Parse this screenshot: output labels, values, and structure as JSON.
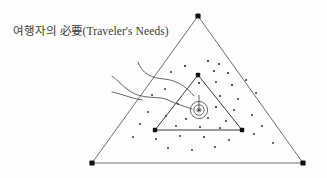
{
  "figure": {
    "caption": "여행자의 必要(Traveler's Needs)",
    "caption_korean": "여행자의",
    "caption_hanja": "必要",
    "caption_english": "(Traveler's Needs)",
    "background_color": "#fdfdfd",
    "line_color": "#4a4a4a",
    "dot_color": "#222222",
    "vertex_color": "#111111",
    "width": 327,
    "height": 178
  },
  "chart_data": {
    "type": "scatter",
    "title": "여행자의 必要(Traveler's Needs)",
    "xlabel": "",
    "ylabel": "",
    "xlim": [
      0,
      327
    ],
    "ylim": [
      0,
      178
    ],
    "grid": false,
    "legend": "none",
    "annotations": [
      "outer-triangle",
      "inner-triangle",
      "spiral-target",
      "flow-curves"
    ],
    "outer_triangle": {
      "label": "outer-triangle",
      "vertices": [
        {
          "name": "apex",
          "x": 198,
          "y": 16
        },
        {
          "name": "bottom-left",
          "x": 92,
          "y": 163
        },
        {
          "name": "bottom-right",
          "x": 303,
          "y": 163
        }
      ],
      "vertex_marker": "filled-square",
      "vertex_size": 5.0,
      "stroke_width": 0.9
    },
    "inner_triangle": {
      "label": "inner-triangle",
      "vertices": [
        {
          "name": "apex",
          "x": 198,
          "y": 75
        },
        {
          "name": "bottom-left",
          "x": 155,
          "y": 130
        },
        {
          "name": "bottom-right",
          "x": 242,
          "y": 130
        }
      ],
      "vertex_marker": "filled-square",
      "vertex_size": 4.2,
      "stroke_width": 1.0
    },
    "spiral": {
      "label": "spiral-target",
      "center": {
        "x": 199,
        "y": 110
      },
      "radii": [
        2.0,
        5.2,
        8.6
      ],
      "center_dot_radius": 1.1,
      "stem": {
        "x": 199,
        "y_top": 95,
        "y_bottom": 108
      }
    },
    "curves": [
      {
        "name": "flow-curve-upper",
        "path": "M 138,62 C 142,74 152,78 164,79 C 176,80 186,86 194,96"
      },
      {
        "name": "flow-curve-lower",
        "path": "M 112,76 C 122,84 128,92 138,95 C 150,99 160,96 168,100 C 176,104 184,106 192,109"
      },
      {
        "name": "flow-curve-tail",
        "path": "M 112,92 C 122,94 130,98 142,100"
      }
    ],
    "scatter_points": [
      {
        "x": 185,
        "y": 66,
        "r": 1.0
      },
      {
        "x": 208,
        "y": 61,
        "r": 1.0
      },
      {
        "x": 219,
        "y": 64,
        "r": 1.0
      },
      {
        "x": 171,
        "y": 72,
        "r": 0.9
      },
      {
        "x": 214,
        "y": 71,
        "r": 1.0
      },
      {
        "x": 228,
        "y": 73,
        "r": 1.0
      },
      {
        "x": 199,
        "y": 83,
        "r": 1.0
      },
      {
        "x": 216,
        "y": 82,
        "r": 0.9
      },
      {
        "x": 232,
        "y": 85,
        "r": 1.0
      },
      {
        "x": 165,
        "y": 89,
        "r": 0.9
      },
      {
        "x": 246,
        "y": 80,
        "r": 1.0
      },
      {
        "x": 152,
        "y": 95,
        "r": 0.9
      },
      {
        "x": 220,
        "y": 96,
        "r": 1.0
      },
      {
        "x": 238,
        "y": 99,
        "r": 0.9
      },
      {
        "x": 256,
        "y": 93,
        "r": 0.9
      },
      {
        "x": 178,
        "y": 104,
        "r": 0.9
      },
      {
        "x": 216,
        "y": 107,
        "r": 1.0
      },
      {
        "x": 234,
        "y": 110,
        "r": 0.9
      },
      {
        "x": 148,
        "y": 112,
        "r": 0.9
      },
      {
        "x": 166,
        "y": 116,
        "r": 0.9
      },
      {
        "x": 186,
        "y": 119,
        "r": 0.9
      },
      {
        "x": 208,
        "y": 118,
        "r": 0.9
      },
      {
        "x": 226,
        "y": 121,
        "r": 0.9
      },
      {
        "x": 252,
        "y": 115,
        "r": 0.9
      },
      {
        "x": 140,
        "y": 124,
        "r": 0.9
      },
      {
        "x": 176,
        "y": 126,
        "r": 0.9
      },
      {
        "x": 200,
        "y": 127,
        "r": 0.9
      },
      {
        "x": 220,
        "y": 128,
        "r": 0.9
      },
      {
        "x": 262,
        "y": 126,
        "r": 0.9
      },
      {
        "x": 133,
        "y": 137,
        "r": 0.9
      },
      {
        "x": 156,
        "y": 139,
        "r": 0.9
      },
      {
        "x": 180,
        "y": 136,
        "r": 0.9
      },
      {
        "x": 204,
        "y": 137,
        "r": 0.9
      },
      {
        "x": 229,
        "y": 140,
        "r": 0.9
      },
      {
        "x": 254,
        "y": 134,
        "r": 0.9
      },
      {
        "x": 168,
        "y": 148,
        "r": 0.9
      },
      {
        "x": 192,
        "y": 150,
        "r": 0.9
      },
      {
        "x": 215,
        "y": 147,
        "r": 0.9
      },
      {
        "x": 273,
        "y": 143,
        "r": 0.9
      }
    ]
  }
}
